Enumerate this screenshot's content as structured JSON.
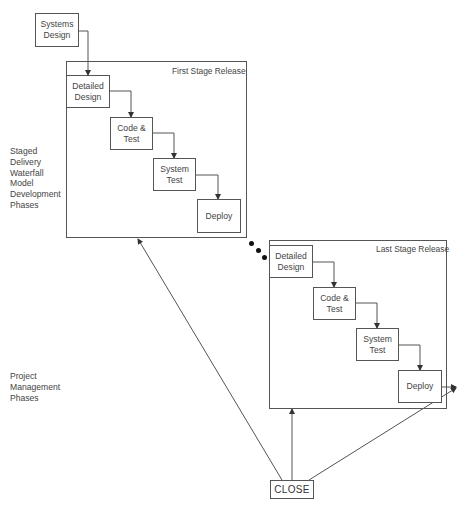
{
  "diagram": {
    "systems_design": {
      "label": "Systems\nDesign"
    },
    "side_labels": {
      "waterfall": "Staged\nDelivery\nWaterfall\nModel\nDevelopment\nPhases",
      "project_mgmt": "Project\nManagement\nPhases"
    },
    "first_stage": {
      "title": "First Stage Release",
      "steps": [
        {
          "label": "Detailed\nDesign"
        },
        {
          "label": "Code &\nTest"
        },
        {
          "label": "System\nTest"
        },
        {
          "label": "Deploy"
        }
      ]
    },
    "last_stage": {
      "title": "Last Stage Release",
      "steps": [
        {
          "label": "Detailed\nDesign"
        },
        {
          "label": "Code &\nTest"
        },
        {
          "label": "System\nTest"
        },
        {
          "label": "Deploy"
        }
      ]
    },
    "close": {
      "label": "CLOSE"
    },
    "continuation_dots": 3
  },
  "colors": {
    "line": "#555555",
    "text": "#444444",
    "background": "#ffffff"
  }
}
